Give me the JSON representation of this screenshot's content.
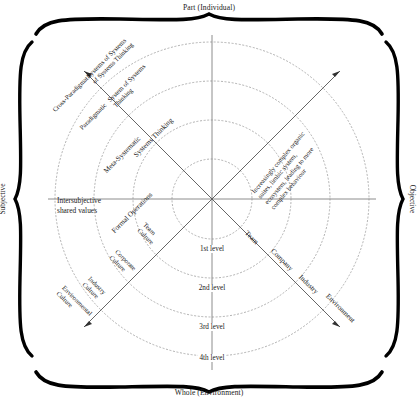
{
  "diagram": {
    "title_top": "Part (Individual)",
    "title_bottom": "Whole (Environment)",
    "axis_left": "Subjective",
    "axis_right": "Objective",
    "note_intersubjective": "Intersubjective",
    "note_intersubjective2": "shared values",
    "levels": [
      "1st level",
      "2nd level",
      "3rd level",
      "4th level"
    ],
    "upper_left_axis": [
      "Formal Operations",
      "Systems Thinking",
      "Meta-Systematic",
      "Paradigmatic",
      "System of Systems",
      "Thinking",
      "Cross-Paradigmatic",
      "Systems of Systems",
      "of Systems Thinking"
    ],
    "quadrant_upper_left": {
      "label_1": "Formal Operations",
      "label_2": "Systems Thinking",
      "label_3": "Meta-Systematic",
      "label_4": "Paradigmatic",
      "label_4b": "System of Systems",
      "label_4c": "Thinking",
      "label_5": "Cross-Paradigmatic",
      "label_5b": "Systems of Systems",
      "label_5c": "of Systems Thinking"
    },
    "quadrant_upper_right": {
      "line1": "Increasingly complex organic",
      "line2": "suites, limbic system,",
      "line3": "ecosystem, leading to more",
      "line4": "complex behaviour"
    },
    "quadrant_lower_left": {
      "label_1": "Team",
      "label_1b": "Culture",
      "label_2": "Corporate",
      "label_2b": "Culture",
      "label_3": "Industry",
      "label_3b": "Culture",
      "label_4": "Environmental",
      "label_4b": "Culture"
    },
    "quadrant_lower_right": {
      "label_1": "Team",
      "label_2": "Company",
      "label_3": "Industry",
      "label_4": "Environment"
    },
    "colors": {
      "ink": "#1a1a1a",
      "axis": "#808080",
      "dotted": "#a8a8a8",
      "bracket": "#000000"
    },
    "geometry": {
      "center_x": 212,
      "center_y": 199,
      "radii": [
        40,
        79,
        118,
        157
      ]
    }
  }
}
